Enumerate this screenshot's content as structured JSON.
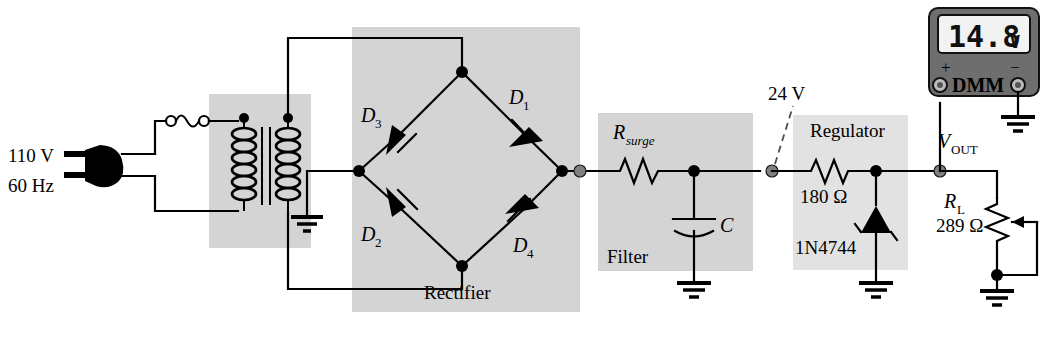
{
  "figure": {
    "background_color": "#ffffff",
    "shade_color": "#d4d4d4"
  },
  "source": {
    "voltage_label": "110 V",
    "frequency_label": "60 Hz",
    "plug_icon": "power-plug-icon",
    "fuse_icon": "fuse-icon"
  },
  "blocks": {
    "transformer_label": "",
    "rectifier_label": "Rectifier",
    "filter_label": "Filter",
    "regulator_label": "Regulator"
  },
  "rectifier": {
    "diodes": [
      {
        "name": "D",
        "sub": "1"
      },
      {
        "name": "D",
        "sub": "2"
      },
      {
        "name": "D",
        "sub": "3"
      },
      {
        "name": "D",
        "sub": "4"
      }
    ],
    "d1_label": "D",
    "d1_sub": "1",
    "d2_label": "D",
    "d2_sub": "2",
    "d3_label": "D",
    "d3_sub": "3",
    "d4_label": "D",
    "d4_sub": "4"
  },
  "filter": {
    "resistor_label": "R",
    "resistor_sub": "surge",
    "capacitor_label": "C"
  },
  "regulator": {
    "resistor_value": "180 Ω",
    "zener_part": "1N4744",
    "node_annotation": "24 V"
  },
  "load": {
    "label": "R",
    "sub": "L",
    "value": "289 Ω",
    "output_label": "V",
    "output_sub": "OUT"
  },
  "dmm": {
    "reading": "14.8",
    "unit": "V",
    "name": "DMM",
    "positive_terminal": "+",
    "negative_terminal": "−"
  }
}
